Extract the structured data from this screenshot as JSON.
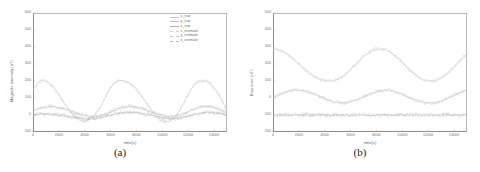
{
  "figure": {
    "panels": [
      {
        "caption": "(a)",
        "xlabel": "time(s)",
        "ylabel": "Magnetic anomaly (nT)",
        "yticks": [
          "600",
          "500",
          "400",
          "300",
          "200",
          "100",
          "0",
          "-100"
        ],
        "xticks": [
          "0",
          "2000",
          "4000",
          "6000",
          "8000",
          "10000",
          "12000",
          "14000"
        ],
        "legend": [
          {
            "label": "x_true",
            "color": "#c8c8c8",
            "style": "solid"
          },
          {
            "label": "y_true",
            "color": "#bdbdbd",
            "style": "solid"
          },
          {
            "label": "z_true",
            "color": "#b2b2b2",
            "style": "solid"
          },
          {
            "label": "x_estimate",
            "color": "#cfcfcf",
            "style": "dash"
          },
          {
            "label": "y_estimate",
            "color": "#c4c4c4",
            "style": "dash"
          },
          {
            "label": "z_estimate",
            "color": "#b8b8b8",
            "style": "dash"
          }
        ]
      },
      {
        "caption": "(b)",
        "xlabel": "time(s)",
        "ylabel": "Bias error (nT)",
        "yticks": [
          "500",
          "400",
          "300",
          "200",
          "100",
          "0",
          "-100",
          "-200"
        ],
        "xticks": [
          "0",
          "2000",
          "4000",
          "6000",
          "8000",
          "10000",
          "12000",
          "14000"
        ],
        "legend": [
          {
            "label": "x_true",
            "color": "#c8c8c8",
            "style": "solid"
          },
          {
            "label": "y_true",
            "color": "#bdbdbd",
            "style": "solid"
          },
          {
            "label": "z_true",
            "color": "#b2b2b2",
            "style": "solid"
          },
          {
            "label": "x_estimate",
            "color": "#cfcfcf",
            "style": "dash"
          },
          {
            "label": "y_estimate",
            "color": "#c4c4c4",
            "style": "dash"
          },
          {
            "label": "z_estimate",
            "color": "#b8b8b8",
            "style": "dash"
          }
        ]
      }
    ]
  },
  "chart_data": [
    {
      "type": "line",
      "title": "(a)",
      "xlabel": "time(s)",
      "ylabel": "Magnetic anomaly (nT)",
      "xlim": [
        0,
        15000
      ],
      "ylim": [
        -100,
        600
      ],
      "xticks": [
        0,
        2000,
        4000,
        6000,
        8000,
        10000,
        12000,
        14000
      ],
      "yticks": [
        -100,
        0,
        100,
        200,
        300,
        400,
        500,
        600
      ],
      "grid": false,
      "legend_position": "top-right",
      "x": [
        0,
        500,
        1000,
        1500,
        2000,
        2500,
        3000,
        3500,
        4000,
        4500,
        5000,
        5500,
        6000,
        6500,
        7000,
        7500,
        8000,
        8500,
        9000,
        9500,
        10000,
        10500,
        11000,
        11500,
        12000,
        12500,
        13000,
        13500,
        14000,
        14500,
        15000
      ],
      "series": [
        {
          "name": "x_true",
          "style": "solid",
          "color": "#c8c8c8",
          "values": [
            150,
            198,
            200,
            170,
            120,
            62,
            10,
            -26,
            -36,
            -18,
            22,
            90,
            160,
            198,
            200,
            186,
            150,
            100,
            44,
            -4,
            -34,
            -36,
            -10,
            48,
            120,
            180,
            200,
            196,
            160,
            100,
            30
          ]
        },
        {
          "name": "y_true",
          "style": "solid",
          "color": "#bdbdbd",
          "values": [
            20,
            38,
            48,
            50,
            44,
            34,
            20,
            6,
            -4,
            -10,
            -8,
            2,
            18,
            34,
            46,
            50,
            46,
            36,
            22,
            8,
            -4,
            -10,
            -8,
            2,
            18,
            36,
            48,
            50,
            44,
            30,
            14
          ]
        },
        {
          "name": "z_true",
          "style": "solid",
          "color": "#b2b2b2",
          "values": [
            0,
            4,
            6,
            4,
            0,
            -6,
            -12,
            -18,
            -22,
            -22,
            -18,
            -10,
            0,
            8,
            14,
            16,
            14,
            8,
            0,
            -8,
            -16,
            -22,
            -22,
            -16,
            -6,
            4,
            12,
            16,
            14,
            8,
            0
          ]
        },
        {
          "name": "x_estimate",
          "style": "dash",
          "color": "#cfcfcf",
          "values": [
            148,
            196,
            202,
            168,
            118,
            60,
            12,
            -24,
            -38,
            -16,
            24,
            88,
            162,
            196,
            202,
            184,
            152,
            98,
            46,
            -2,
            -36,
            -34,
            -12,
            50,
            118,
            182,
            198,
            198,
            158,
            102,
            28
          ]
        },
        {
          "name": "y_estimate",
          "style": "dash",
          "color": "#c4c4c4",
          "values": [
            22,
            40,
            46,
            52,
            42,
            36,
            18,
            8,
            -2,
            -12,
            -6,
            4,
            16,
            36,
            44,
            52,
            44,
            38,
            20,
            10,
            -2,
            -12,
            -6,
            4,
            20,
            34,
            50,
            48,
            46,
            28,
            16
          ]
        },
        {
          "name": "z_estimate",
          "style": "dash",
          "color": "#b8b8b8",
          "values": [
            2,
            6,
            4,
            6,
            -2,
            -4,
            -14,
            -16,
            -24,
            -20,
            -20,
            -8,
            2,
            6,
            16,
            14,
            16,
            6,
            2,
            -6,
            -18,
            -20,
            -24,
            -14,
            -8,
            6,
            10,
            18,
            12,
            10,
            -2
          ]
        }
      ]
    },
    {
      "type": "line",
      "title": "(b)",
      "xlabel": "time(s)",
      "ylabel": "Bias error (nT)",
      "xlim": [
        0,
        15000
      ],
      "ylim": [
        -200,
        500
      ],
      "xticks": [
        0,
        2000,
        4000,
        6000,
        8000,
        10000,
        12000,
        14000
      ],
      "yticks": [
        -200,
        -100,
        0,
        100,
        200,
        300,
        400,
        500
      ],
      "grid": false,
      "legend_position": "top-right",
      "x": [
        0,
        500,
        1000,
        1500,
        2000,
        2500,
        3000,
        3500,
        4000,
        4500,
        5000,
        5500,
        6000,
        6500,
        7000,
        7500,
        8000,
        8500,
        9000,
        9500,
        10000,
        10500,
        11000,
        11500,
        12000,
        12500,
        13000,
        13500,
        14000,
        14500,
        15000
      ],
      "series": [
        {
          "name": "x_true",
          "style": "solid",
          "color": "#c8c8c8",
          "values": [
            290,
            282,
            262,
            234,
            200,
            166,
            136,
            114,
            102,
            100,
            110,
            134,
            168,
            206,
            244,
            272,
            288,
            288,
            272,
            244,
            208,
            170,
            136,
            112,
            100,
            102,
            118,
            146,
            182,
            222,
            258
          ]
        },
        {
          "name": "y_true",
          "style": "solid",
          "color": "#bdbdbd",
          "values": [
            0,
            20,
            36,
            44,
            46,
            40,
            28,
            12,
            -4,
            -18,
            -26,
            -28,
            -22,
            -10,
            6,
            22,
            36,
            44,
            44,
            36,
            22,
            4,
            -12,
            -24,
            -30,
            -28,
            -18,
            -2,
            16,
            34,
            46
          ]
        },
        {
          "name": "z_true",
          "style": "solid",
          "color": "#b2b2b2",
          "values": [
            -100,
            -98,
            -100,
            -102,
            -99,
            -100,
            -101,
            -98,
            -100,
            -102,
            -99,
            -100,
            -101,
            -99,
            -100,
            -102,
            -100,
            -98,
            -101,
            -100,
            -99,
            -101,
            -100,
            -98,
            -100,
            -102,
            -99,
            -100,
            -101,
            -99,
            -100
          ]
        },
        {
          "name": "x_estimate",
          "style": "dash",
          "color": "#cfcfcf",
          "values": [
            288,
            280,
            264,
            232,
            202,
            164,
            138,
            112,
            104,
            98,
            112,
            132,
            170,
            204,
            246,
            270,
            290,
            286,
            274,
            242,
            210,
            168,
            138,
            110,
            102,
            100,
            120,
            144,
            184,
            220,
            260
          ]
        },
        {
          "name": "y_estimate",
          "style": "dash",
          "color": "#c4c4c4",
          "values": [
            2,
            22,
            34,
            46,
            44,
            42,
            26,
            14,
            -2,
            -20,
            -24,
            -30,
            -20,
            -12,
            8,
            20,
            38,
            42,
            46,
            34,
            24,
            2,
            -14,
            -22,
            -32,
            -26,
            -20,
            0,
            18,
            32,
            48
          ]
        },
        {
          "name": "z_estimate",
          "style": "dash",
          "color": "#b8b8b8",
          "values": [
            -102,
            -100,
            -98,
            -100,
            -101,
            -98,
            -100,
            -100,
            -102,
            -100,
            -98,
            -101,
            -100,
            -100,
            -98,
            -100,
            -102,
            -100,
            -99,
            -101,
            -100,
            -100,
            -98,
            -100,
            -101,
            -100,
            -100,
            -98,
            -100,
            -101,
            -99
          ]
        }
      ]
    }
  ]
}
